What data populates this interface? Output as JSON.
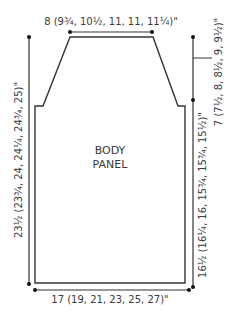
{
  "diagram": {
    "type": "knitting-schematic",
    "panel_label_line1": "BODY",
    "panel_label_line2": "PANEL",
    "dimensions": {
      "top_width": "8 (9¾, 10½, 11, 11, 11¼)\"",
      "armhole_depth": "7 (7½, 8, 8½, 9, 9½)\"",
      "total_length": "23½ (23¾, 24, 24¼, 24¾, 25)\"",
      "side_length": "16½ (16¼, 16, 15¾, 15¾, 15½)\"",
      "bottom_width": "17 (19, 21, 23, 25, 27)\""
    },
    "colors": {
      "line": "#333333",
      "text": "#3a3a3a",
      "background": "#ffffff"
    }
  }
}
